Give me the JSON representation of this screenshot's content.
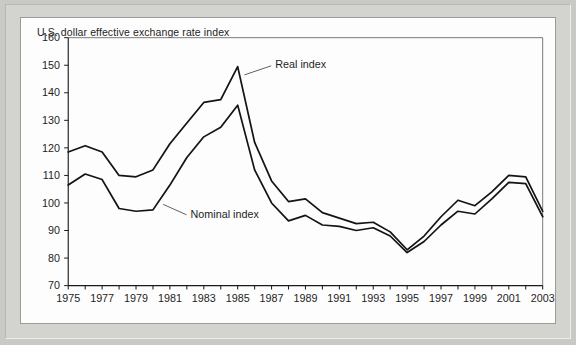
{
  "figure": {
    "title": "U.S. dollar effective exchange rate index",
    "border_color": "#d3d3d0",
    "plot_background": "#fdfdfd",
    "line_color": "#141414"
  },
  "annotations": {
    "real_label": "Real index",
    "nominal_label": "Nominal index"
  },
  "chart_data": {
    "type": "line",
    "title": "U.S. dollar effective exchange rate index",
    "xlabel": "",
    "ylabel": "",
    "xlim": [
      1975,
      2003
    ],
    "ylim": [
      70,
      160
    ],
    "grid": false,
    "legend": "inline-annotations",
    "y_ticks": [
      70,
      80,
      90,
      100,
      110,
      120,
      130,
      140,
      150,
      160
    ],
    "x_ticks": [
      1975,
      1976,
      1977,
      1978,
      1979,
      1980,
      1981,
      1982,
      1983,
      1984,
      1985,
      1986,
      1987,
      1988,
      1989,
      1990,
      1991,
      1992,
      1993,
      1994,
      1995,
      1996,
      1997,
      1998,
      1999,
      2000,
      2001,
      2002,
      2003
    ],
    "x_tick_labels": [
      "1975",
      "",
      "1977",
      "",
      "1979",
      "",
      "1981",
      "",
      "1983",
      "",
      "1985",
      "",
      "1987",
      "",
      "1989",
      "",
      "1991",
      "",
      "1993",
      "",
      "1995",
      "",
      "1997",
      "",
      "1999",
      "",
      "2001",
      "",
      "2003"
    ],
    "x": [
      1975,
      1976,
      1977,
      1978,
      1979,
      1980,
      1981,
      1982,
      1983,
      1984,
      1985,
      1986,
      1987,
      1988,
      1989,
      1990,
      1991,
      1992,
      1993,
      1994,
      1995,
      1996,
      1997,
      1998,
      1999,
      2000,
      2001,
      2002,
      2003
    ],
    "series": [
      {
        "name": "Real index",
        "values": [
          118.5,
          120.8,
          118.5,
          110.0,
          109.5,
          112.0,
          121.5,
          129.0,
          136.5,
          137.5,
          149.5,
          122.0,
          108.0,
          100.5,
          101.5,
          96.5,
          94.5,
          92.5,
          93.0,
          89.5,
          83.0,
          88.0,
          95.0,
          101.0,
          99.0,
          104.0,
          110.0,
          109.5,
          97.0
        ]
      },
      {
        "name": "Nominal index",
        "values": [
          106.5,
          110.5,
          108.5,
          98.0,
          97.0,
          97.5,
          106.5,
          116.5,
          124.0,
          127.5,
          135.5,
          112.0,
          100.0,
          93.5,
          95.5,
          92.0,
          91.5,
          90.0,
          91.0,
          88.0,
          82.0,
          86.0,
          92.0,
          97.0,
          96.0,
          101.5,
          107.5,
          107.0,
          95.0
        ]
      }
    ],
    "annotations": [
      {
        "text": "Real index",
        "near_x": 1985,
        "near_y": 147
      },
      {
        "text": "Nominal index",
        "near_x": 1981,
        "near_y": 98
      }
    ]
  }
}
